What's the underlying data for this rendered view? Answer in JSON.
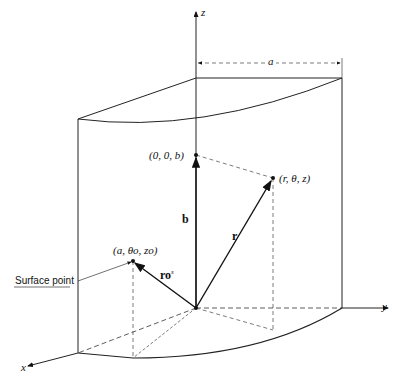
{
  "diagram": {
    "axes": {
      "x": "x",
      "y": "y",
      "z": "z"
    },
    "dimension_label": "a",
    "points": {
      "axis_point": "(0, 0, b)",
      "field_point": "(r, θ, z)",
      "surface_point": "(a, θo, zo)"
    },
    "vectors": {
      "b": "b",
      "r": "r",
      "r_surface": "ro",
      "r_surface_sup": "s"
    },
    "callout": "Surface point",
    "caption": "Figure"
  }
}
